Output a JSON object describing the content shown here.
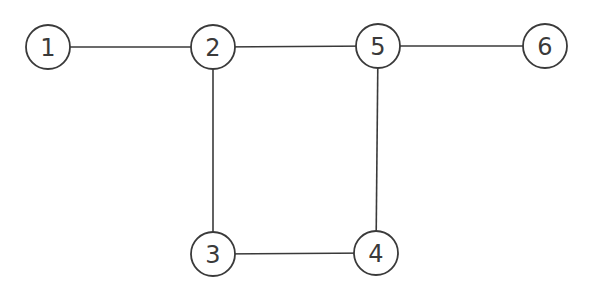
{
  "graph": {
    "nodes": [
      {
        "id": "1",
        "label": "1",
        "x": 48,
        "y": 47
      },
      {
        "id": "2",
        "label": "2",
        "x": 213,
        "y": 47
      },
      {
        "id": "5",
        "label": "5",
        "x": 378,
        "y": 46
      },
      {
        "id": "6",
        "label": "6",
        "x": 545,
        "y": 46
      },
      {
        "id": "3",
        "label": "3",
        "x": 213,
        "y": 254
      },
      {
        "id": "4",
        "label": "4",
        "x": 376,
        "y": 253
      }
    ],
    "edges": [
      {
        "from": "1",
        "to": "2"
      },
      {
        "from": "2",
        "to": "5"
      },
      {
        "from": "5",
        "to": "6"
      },
      {
        "from": "2",
        "to": "3"
      },
      {
        "from": "5",
        "to": "4"
      },
      {
        "from": "3",
        "to": "4"
      }
    ],
    "node_radius": 22,
    "line_color": "#3a3a3a",
    "background": "#ffffff"
  }
}
